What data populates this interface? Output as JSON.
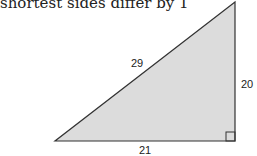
{
  "caption": "shortest sides differ by 1",
  "triangle": {
    "hypotenuse_label": "29",
    "vertical_leg_label": "20",
    "horizontal_leg_label": "21",
    "fill_color": "#dcdcdc",
    "stroke_color": "#333333",
    "right_angle": "bottom-right"
  }
}
